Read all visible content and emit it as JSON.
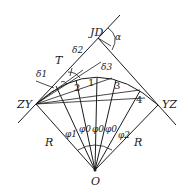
{
  "diagram": {
    "labels": {
      "jd": "JD",
      "alpha": "α",
      "t": "T",
      "delta1": "δ1",
      "delta2": "δ2",
      "delta3": "δ3",
      "zy": "ZY",
      "yz": "YZ",
      "r_left": "R",
      "r_right": "R",
      "o": "O",
      "phi1": "φ1",
      "phi0_a": "φ0",
      "phi0_b": "φ0",
      "phi0_c": "φ0",
      "phi2": "φ2",
      "p1": "1",
      "p2": "2",
      "p3": "3",
      "p4": "4"
    },
    "points": {
      "ZY": [
        36,
        104
      ],
      "YZ": [
        158,
        105
      ],
      "JD": [
        98,
        38
      ],
      "O": [
        95,
        170
      ]
    }
  }
}
